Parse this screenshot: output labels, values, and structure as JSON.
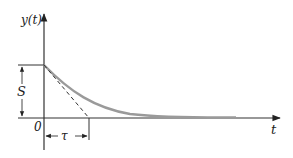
{
  "diagram": {
    "type": "exponential-decay-response",
    "y_axis_label": "y(t)",
    "x_axis_label": "t",
    "origin_label": "0",
    "step_label": "S",
    "time_constant_label": "τ",
    "colors": {
      "axis": "#333333",
      "curve": "#9a9a9a",
      "tangent": "#333333"
    }
  }
}
